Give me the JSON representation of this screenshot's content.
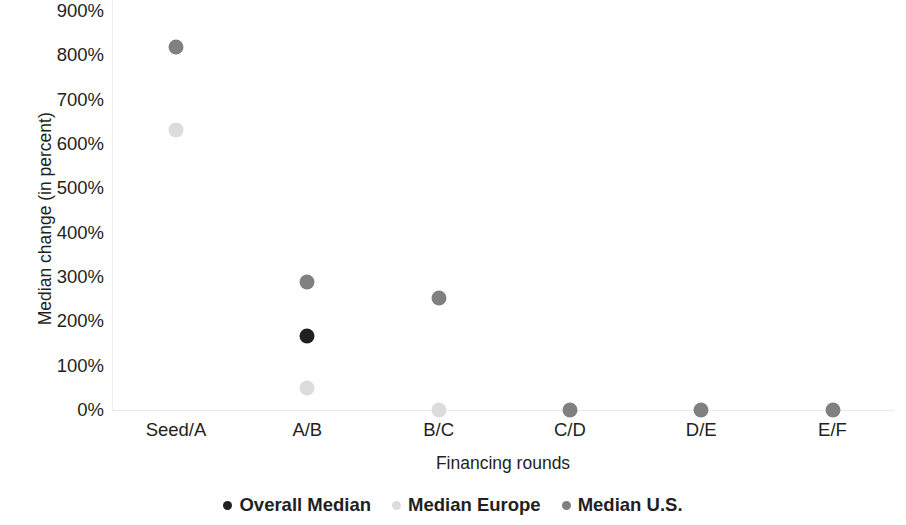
{
  "chart_data": {
    "type": "scatter",
    "title": "",
    "xlabel": "Financing rounds",
    "ylabel": "Median change (in percent)",
    "categories": [
      "Seed/A",
      "A/B",
      "B/C",
      "C/D",
      "D/E",
      "E/F"
    ],
    "yticklabels": [
      "900%",
      "800%",
      "700%",
      "600%",
      "500%",
      "400%",
      "300%",
      "200%",
      "100%",
      "0%"
    ],
    "ytickvalues": [
      900,
      800,
      700,
      600,
      500,
      400,
      300,
      200,
      100,
      0
    ],
    "ylim": [
      0,
      900
    ],
    "grid": false,
    "legend_position": "bottom",
    "series": [
      {
        "name": "Overall Median",
        "color": "#231f20",
        "values": [
          null,
          168,
          null,
          null,
          null,
          null
        ]
      },
      {
        "name": "Median Europe",
        "color": "#dcdcdc",
        "values": [
          632,
          50,
          0,
          null,
          null,
          null
        ]
      },
      {
        "name": "Median U.S.",
        "color": "#808080",
        "values": [
          818,
          288,
          252,
          0,
          0,
          0
        ]
      }
    ]
  },
  "legend": {
    "items": [
      {
        "label": "Overall Median",
        "color": "#231f20"
      },
      {
        "label": "Median Europe",
        "color": "#dcdcdc"
      },
      {
        "label": "Median U.S.",
        "color": "#808080"
      }
    ]
  }
}
